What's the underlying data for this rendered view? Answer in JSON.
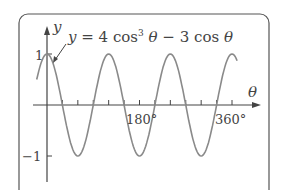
{
  "chart_data": {
    "type": "line",
    "title_parts": {
      "lhs": "y = 4 cos",
      "exp": "3",
      "mid": "θ  − 3 cos θ"
    },
    "xlabel": "θ",
    "ylabel": "y",
    "x_tick_labels": [
      "180°",
      "360°"
    ],
    "y_tick_labels": [
      "1",
      "−1"
    ],
    "xlim": [
      -20,
      380
    ],
    "ylim": [
      -1,
      1
    ],
    "x_ticks_every_deg": 30,
    "function": "4cos^3(θ) - 3cos(θ) = cos(3θ)",
    "x": [
      0,
      30,
      60,
      90,
      120,
      150,
      180,
      210,
      240,
      270,
      300,
      330,
      360
    ],
    "values": [
      1,
      0,
      -1,
      0,
      1,
      0,
      -1,
      0,
      1,
      0,
      -1,
      0,
      1
    ],
    "grid": false,
    "legend": "none"
  },
  "labels": {
    "y_axis": "y",
    "x_axis": "θ",
    "one": "1",
    "minus_one": "−1",
    "t180": "180°",
    "t360": "360°",
    "eq_lhs": "y = 4 cos",
    "eq_exp": "3",
    "eq_rest": "θ  − 3 cos θ"
  },
  "colors": {
    "curve": "#8a8a8a",
    "axes": "#444444",
    "frame": "#555555"
  }
}
